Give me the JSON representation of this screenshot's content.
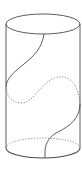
{
  "figure": {
    "title": "",
    "colors": {
      "background": "#ffffff",
      "stroke": "#4a4a4a",
      "hidden_stroke": "#7a7a7a"
    },
    "cylinder": {
      "cx": 43,
      "rx": 37,
      "ry": 10,
      "top_cy": 24,
      "bottom_cy": 148
    }
  }
}
